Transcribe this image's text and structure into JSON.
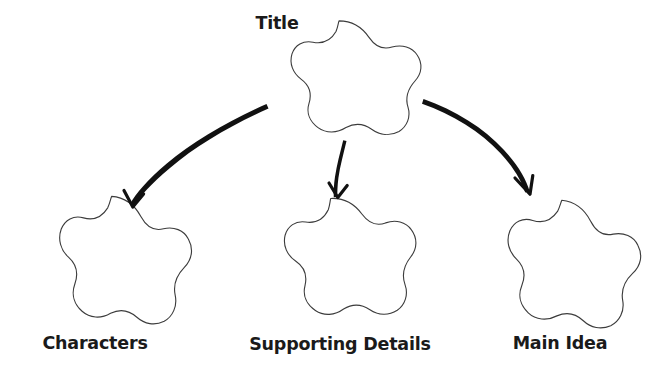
{
  "document": {
    "type": "graphic-organizer",
    "title_text": "Title",
    "background_color": "#ffffff",
    "outline_color": "#3c3c3c",
    "arrow_color": "#111111",
    "label_color": "#1a1a1a"
  },
  "nodes": [
    {
      "id": "title",
      "label": "Title",
      "role": "root",
      "shape": "five-lobed-cloud",
      "label_position": "upper-left",
      "center": {
        "x": 339,
        "y": 81
      },
      "label_anchor": {
        "x": 277,
        "y": 29
      },
      "radius": 62
    },
    {
      "id": "characters",
      "label": "Characters",
      "role": "branch",
      "shape": "five-lobed-cloud",
      "label_position": "below",
      "center": {
        "x": 107,
        "y": 262
      },
      "label_anchor": {
        "x": 95,
        "y": 349
      },
      "radius": 62
    },
    {
      "id": "supporting-details",
      "label": "Supporting Details",
      "role": "branch",
      "shape": "five-lobed-cloud",
      "label_position": "below",
      "center": {
        "x": 334,
        "y": 261
      },
      "label_anchor": {
        "x": 340,
        "y": 350
      },
      "radius": 62
    },
    {
      "id": "main-idea",
      "label": "Main Idea",
      "role": "branch",
      "shape": "five-lobed-cloud",
      "label_position": "below",
      "center": {
        "x": 555,
        "y": 265
      },
      "label_anchor": {
        "x": 560,
        "y": 349
      },
      "radius": 62
    }
  ],
  "connectors": [
    {
      "id": "arrow-title-to-characters",
      "from": "title",
      "to": "characters",
      "style": "hand-drawn-curved-arrow",
      "direction": "down-left",
      "start": {
        "x": 267,
        "y": 110
      },
      "end": {
        "x": 133,
        "y": 207
      }
    },
    {
      "id": "arrow-title-to-supporting-details",
      "from": "title",
      "to": "supporting-details",
      "style": "hand-drawn-curved-arrow",
      "direction": "down",
      "start": {
        "x": 345,
        "y": 142
      },
      "end": {
        "x": 338,
        "y": 197
      }
    },
    {
      "id": "arrow-title-to-main-idea",
      "from": "title",
      "to": "main-idea",
      "style": "hand-drawn-curved-arrow",
      "direction": "down-right",
      "start": {
        "x": 424,
        "y": 100
      },
      "end": {
        "x": 530,
        "y": 194
      }
    }
  ]
}
